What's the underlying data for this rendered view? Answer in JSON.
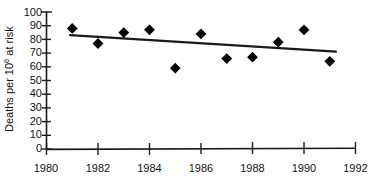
{
  "chart_data": {
    "type": "scatter",
    "title": "",
    "xlabel": "",
    "ylabel": "Deaths per 10",
    "ylabel_sup": "6",
    "ylabel_tail": " at risk",
    "x": [
      1981,
      1982,
      1983,
      1984,
      1985,
      1986,
      1987,
      1988,
      1989,
      1990,
      1991
    ],
    "values": [
      88,
      77,
      85,
      87,
      59,
      84,
      66,
      67,
      78,
      87,
      64
    ],
    "series": [
      {
        "name": "Deaths per 10^6 at risk",
        "marker": "filled-diamond",
        "color": "#000000",
        "values": [
          88,
          77,
          85,
          87,
          59,
          84,
          66,
          67,
          78,
          87,
          64
        ]
      },
      {
        "name": "linear trend",
        "type": "line",
        "color": "#1a1a1a",
        "x": [
          1980.95,
          1991.35
        ],
        "values": [
          83,
          71
        ]
      }
    ],
    "xlim": [
      1980,
      1992
    ],
    "ylim": [
      0,
      100
    ],
    "xticks": [
      1980,
      1982,
      1984,
      1986,
      1988,
      1990,
      1992
    ],
    "xtick_labels": [
      "1980",
      "1982",
      "1984",
      "1986",
      "1988",
      "1990",
      "1992"
    ],
    "yticks": [
      0,
      10,
      20,
      30,
      40,
      50,
      60,
      70,
      80,
      90,
      100
    ],
    "ytick_labels": [
      "0",
      "10",
      "20",
      "30",
      "40",
      "50",
      "60",
      "70",
      "80",
      "90",
      "100"
    ],
    "grid": false,
    "legend": "none",
    "axis_color": "#1a1a1a"
  }
}
